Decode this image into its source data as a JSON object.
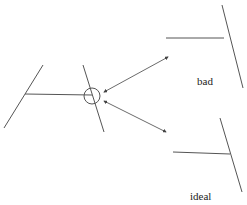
{
  "diagram": {
    "labels": {
      "bad": "bad",
      "ideal": "ideal"
    },
    "colors": {
      "stroke": "#555555",
      "arrow": "#444444",
      "text": "#222222"
    },
    "elements": {
      "original": "T-junction of horizontal segment meeting slanted line, junction circled",
      "bad": "horizontal segment falls short of / crosses slanted line",
      "ideal": "horizontal segment ends exactly on slanted line"
    }
  }
}
